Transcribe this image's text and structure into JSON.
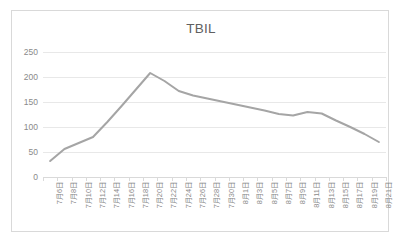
{
  "chart_data": {
    "type": "line",
    "title": "TBIL",
    "xlabel": "",
    "ylabel": "",
    "ylim": [
      0,
      250
    ],
    "ytick_values": [
      0,
      50,
      100,
      150,
      200,
      250
    ],
    "ytick_labels": [
      "0",
      "50",
      "100",
      "150",
      "200",
      "250"
    ],
    "grid": "horizontal",
    "legend": "none",
    "line_color": "#a5a5a5",
    "categories": [
      "7月6日",
      "7月8日",
      "7月10日",
      "7月12日",
      "7月14日",
      "7月16日",
      "7月18日",
      "7月20日",
      "7月22日",
      "7月24日",
      "7月26日",
      "7月28日",
      "7月30日",
      "8月1日",
      "8月3日",
      "8月5日",
      "8月7日",
      "8月9日",
      "8月11日",
      "8月13日",
      "8月15日",
      "8月17日",
      "8月19日",
      "8月21日"
    ],
    "series": [
      {
        "name": "TBIL",
        "values": [
          32,
          56,
          68,
          80,
          110,
          142,
          175,
          208,
          192,
          172,
          163,
          157,
          151,
          145,
          139,
          133,
          126,
          123,
          130,
          127,
          113,
          100,
          86,
          70
        ]
      }
    ]
  },
  "chart": {
    "title": "TBIL"
  }
}
